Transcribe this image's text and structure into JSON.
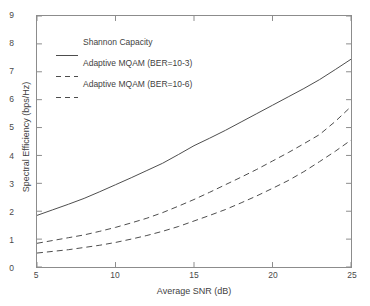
{
  "chart_data": {
    "type": "line",
    "title": "",
    "xlabel": "Average SNR (dB)",
    "ylabel": "Spectral Efficiency (bps/Hz)",
    "xlim": [
      5,
      25
    ],
    "ylim": [
      0,
      9
    ],
    "xticks": [
      "5",
      "10",
      "15",
      "20",
      "25"
    ],
    "yticks": [
      "0",
      "1",
      "2",
      "3",
      "4",
      "5",
      "6",
      "7",
      "8",
      "9"
    ],
    "grid": false,
    "legend_position": "upper-left-inside",
    "x": [
      5,
      6,
      7,
      8,
      9,
      10,
      11,
      12,
      13,
      14,
      15,
      16,
      17,
      18,
      19,
      20,
      21,
      22,
      23,
      24,
      25
    ],
    "series": [
      {
        "name": "Shannon Capacity",
        "style": "solid",
        "color": "#4d4d4d",
        "values": [
          1.85,
          2.05,
          2.25,
          2.46,
          2.7,
          2.95,
          3.2,
          3.46,
          3.72,
          4.03,
          4.35,
          4.62,
          4.9,
          5.2,
          5.5,
          5.8,
          6.1,
          6.4,
          6.72,
          7.08,
          7.45
        ]
      },
      {
        "name": "Adaptive MQAM (BER=10-3)",
        "style": "dashed",
        "color": "#4d4d4d",
        "values": [
          0.85,
          0.95,
          1.05,
          1.15,
          1.28,
          1.42,
          1.58,
          1.75,
          1.95,
          2.18,
          2.42,
          2.68,
          2.95,
          3.22,
          3.5,
          3.8,
          4.1,
          4.42,
          4.75,
          5.22,
          5.75
        ]
      },
      {
        "name": "Adaptive MQAM (BER=10-6)",
        "style": "dashed",
        "color": "#4d4d4d",
        "values": [
          0.5,
          0.56,
          0.62,
          0.7,
          0.78,
          0.88,
          1.0,
          1.13,
          1.28,
          1.45,
          1.65,
          1.85,
          2.06,
          2.3,
          2.55,
          2.82,
          3.1,
          3.42,
          3.78,
          4.15,
          4.55
        ]
      }
    ]
  },
  "axes": {
    "frame_color": "#8c8c8c",
    "background": "#ffffff"
  }
}
